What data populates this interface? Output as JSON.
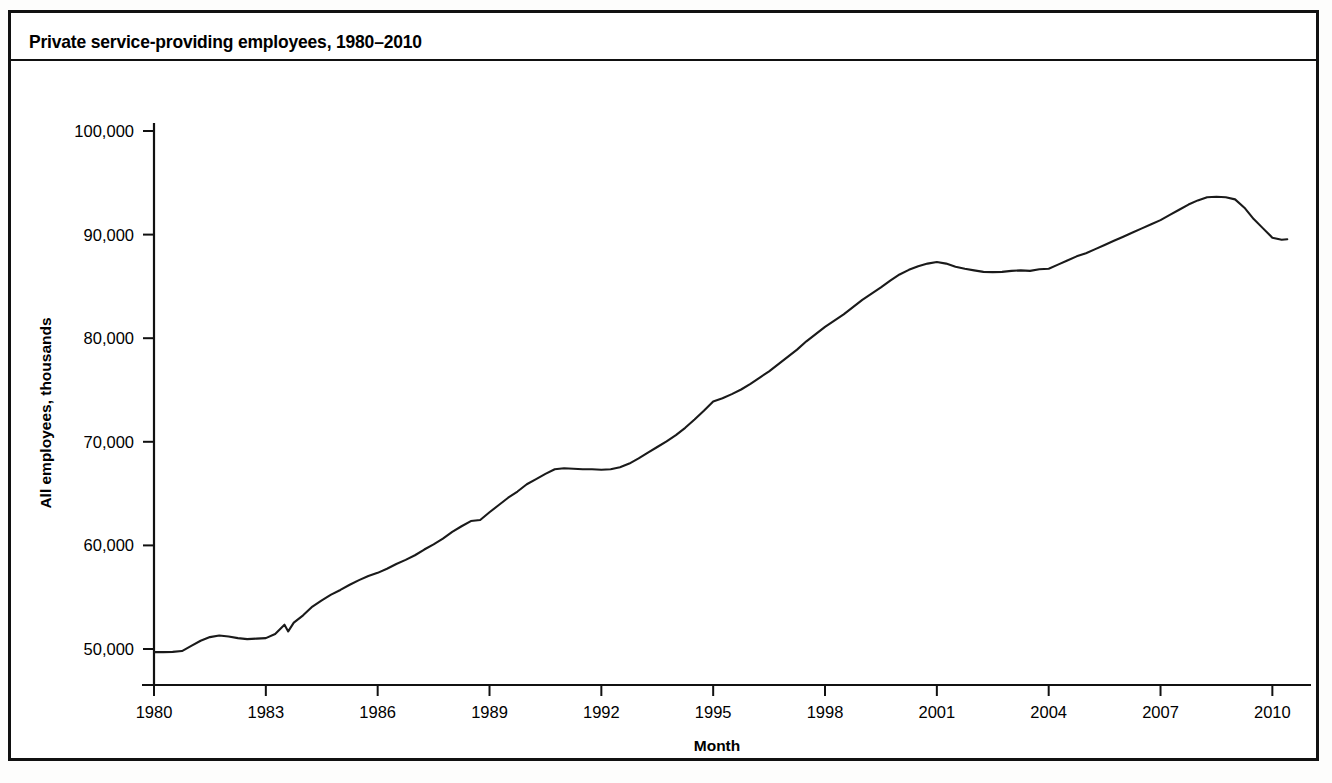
{
  "figure": {
    "title": "Private service-providing employees, 1980–2010",
    "border_color": "#111111",
    "background": "#ffffff"
  },
  "chart_data": {
    "type": "line",
    "title": "Private service-providing employees, 1980–2010",
    "xlabel": "Month",
    "ylabel": "All employees, thousands",
    "series_name": "Private service-providing employees",
    "line_color": "#1a1a1a",
    "grid": false,
    "legend": "none",
    "xlim": [
      1980,
      2010.5
    ],
    "ylim": [
      50000,
      100000
    ],
    "y_ticks": [
      50000,
      60000,
      70000,
      80000,
      90000,
      100000
    ],
    "y_tick_labels": [
      "50,000",
      "60,000",
      "70,000",
      "80,000",
      "90,000",
      "100,000"
    ],
    "x_ticks": [
      1980,
      1983,
      1986,
      1989,
      1992,
      1995,
      1998,
      2001,
      2004,
      2007,
      2010
    ],
    "x_tick_labels": [
      "1980",
      "1983",
      "1986",
      "1989",
      "1992",
      "1995",
      "1998",
      "2001",
      "2004",
      "2007",
      "2010"
    ],
    "x": [
      1980.0,
      1980.25,
      1980.5,
      1980.75,
      1981.0,
      1981.25,
      1981.5,
      1981.75,
      1982.0,
      1982.25,
      1982.5,
      1982.75,
      1983.0,
      1983.25,
      1983.5,
      1983.6,
      1983.75,
      1984.0,
      1984.25,
      1984.5,
      1984.75,
      1985.0,
      1985.25,
      1985.5,
      1985.75,
      1986.0,
      1986.25,
      1986.5,
      1986.75,
      1987.0,
      1987.25,
      1987.5,
      1987.75,
      1988.0,
      1988.25,
      1988.5,
      1988.75,
      1989.0,
      1989.25,
      1989.5,
      1989.75,
      1990.0,
      1990.25,
      1990.5,
      1990.75,
      1991.0,
      1991.25,
      1991.5,
      1991.75,
      1992.0,
      1992.25,
      1992.5,
      1992.75,
      1993.0,
      1993.25,
      1993.5,
      1993.75,
      1994.0,
      1994.25,
      1994.5,
      1994.75,
      1995.0,
      1995.25,
      1995.5,
      1995.75,
      1996.0,
      1996.25,
      1996.5,
      1996.75,
      1997.0,
      1997.25,
      1997.5,
      1997.75,
      1998.0,
      1998.25,
      1998.5,
      1998.75,
      1999.0,
      1999.25,
      1999.5,
      1999.75,
      2000.0,
      2000.25,
      2000.5,
      2000.75,
      2001.0,
      2001.25,
      2001.5,
      2001.75,
      2002.0,
      2002.25,
      2002.5,
      2002.75,
      2003.0,
      2003.25,
      2003.5,
      2003.75,
      2004.0,
      2004.25,
      2004.5,
      2004.75,
      2005.0,
      2005.25,
      2005.5,
      2005.75,
      2006.0,
      2006.25,
      2006.5,
      2006.75,
      2007.0,
      2007.25,
      2007.5,
      2007.75,
      2008.0,
      2008.25,
      2008.5,
      2008.75,
      2009.0,
      2009.25,
      2009.5,
      2009.75,
      2010.0,
      2010.25,
      2010.4
    ],
    "y": [
      49700,
      49700,
      49720,
      49800,
      50300,
      50800,
      51150,
      51300,
      51200,
      51050,
      50950,
      51000,
      51050,
      51450,
      52350,
      51700,
      52550,
      53250,
      54100,
      54700,
      55250,
      55700,
      56200,
      56650,
      57050,
      57350,
      57750,
      58200,
      58600,
      59050,
      59600,
      60100,
      60650,
      61300,
      61850,
      62350,
      62450,
      63200,
      63900,
      64600,
      65200,
      65900,
      66400,
      66900,
      67350,
      67450,
      67400,
      67350,
      67350,
      67300,
      67350,
      67550,
      67900,
      68400,
      68950,
      69500,
      70050,
      70650,
      71350,
      72150,
      73000,
      73900,
      74200,
      74600,
      75050,
      75600,
      76200,
      76800,
      77500,
      78200,
      78900,
      79700,
      80400,
      81100,
      81700,
      82300,
      83000,
      83700,
      84300,
      84900,
      85550,
      86150,
      86600,
      86950,
      87200,
      87350,
      87200,
      86900,
      86700,
      86550,
      86400,
      86380,
      86400,
      86500,
      86550,
      86500,
      86650,
      86700,
      87100,
      87500,
      87900,
      88200,
      88600,
      89000,
      89400,
      89800,
      90200,
      90600,
      91000,
      91400,
      91900,
      92400,
      92900,
      93300,
      93600,
      93650,
      93600,
      93400,
      92600,
      91500,
      90600,
      89700,
      89500,
      89550,
      89700,
      89900,
      89950
    ]
  }
}
